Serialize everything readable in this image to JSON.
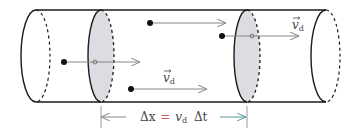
{
  "diagram": {
    "labels": {
      "vd_top": "v",
      "vd_top_sub": "d",
      "vd_mid": "v",
      "vd_mid_sub": "d",
      "eq_delta_x": "Δx",
      "eq_equals": "=",
      "eq_v": "v",
      "eq_v_sub": "d",
      "eq_delta_t": "Δt"
    },
    "colors": {
      "outline": "#1a1a1a",
      "disk_fill": "#dcdde2",
      "arrow": "#888888",
      "equals": "#c0606a",
      "dimension_arrow_right": "#5a9a9a"
    },
    "charges": [
      {
        "x": 64,
        "y": 62
      },
      {
        "x": 150,
        "y": 23
      },
      {
        "x": 222,
        "y": 36
      },
      {
        "x": 131,
        "y": 89
      }
    ]
  }
}
